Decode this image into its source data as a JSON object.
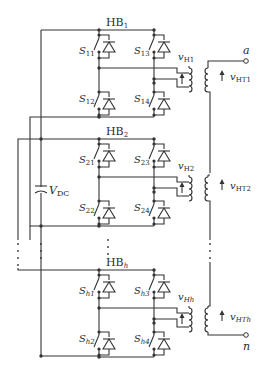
{
  "diagram": {
    "type": "circuit-schematic",
    "dc_source": {
      "label": "V",
      "sub": "DC"
    },
    "bridges": [
      {
        "label": "HB",
        "sub": "1",
        "switches": [
          {
            "n": "S",
            "sub": "11"
          },
          {
            "n": "S",
            "sub": "12"
          },
          {
            "n": "S",
            "sub": "13"
          },
          {
            "n": "S",
            "sub": "14"
          }
        ],
        "vh": {
          "v": "v",
          "sub": "H1"
        },
        "vht": {
          "v": "v",
          "sub": "HT1"
        }
      },
      {
        "label": "HB",
        "sub": "2",
        "switches": [
          {
            "n": "S",
            "sub": "21"
          },
          {
            "n": "S",
            "sub": "22"
          },
          {
            "n": "S",
            "sub": "23"
          },
          {
            "n": "S",
            "sub": "24"
          }
        ],
        "vh": {
          "v": "v",
          "sub": "H2"
        },
        "vht": {
          "v": "v",
          "sub": "HT2"
        }
      },
      {
        "label": "HB",
        "sub": "h",
        "switches": [
          {
            "n": "S",
            "sub": "h1"
          },
          {
            "n": "S",
            "sub": "h2"
          },
          {
            "n": "S",
            "sub": "h3"
          },
          {
            "n": "S",
            "sub": "h4"
          }
        ],
        "vh": {
          "v": "v",
          "sub": "Hh"
        },
        "vht": {
          "v": "v",
          "sub": "HTh"
        }
      }
    ],
    "terminals": {
      "top": "a",
      "bottom": "n"
    },
    "ellipsis": "⋮"
  }
}
